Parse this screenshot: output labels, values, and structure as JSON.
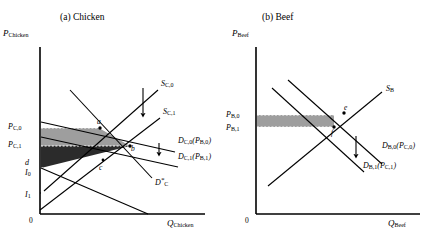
{
  "figure": {
    "panels": [
      {
        "id": "panel-a",
        "title": "(a) Chicken",
        "y_axis_label": "P",
        "y_axis_sub": "Chicken",
        "x_axis_label": "Q",
        "x_axis_sub": "Chicken",
        "origin_label": "0",
        "price_labels": [
          {
            "base": "P",
            "sub": "C,0"
          },
          {
            "base": "P",
            "sub": "C,1"
          }
        ],
        "intercept_labels": [
          {
            "base": "d",
            "sub": ""
          },
          {
            "base": "I",
            "sub": "0"
          },
          {
            "base": "I",
            "sub": "1"
          }
        ],
        "point_labels": [
          "a",
          "b",
          "c"
        ],
        "curve_labels": [
          {
            "base": "S",
            "sub": "C,0",
            "arg": ""
          },
          {
            "base": "S",
            "sub": "C,1",
            "arg": ""
          },
          {
            "base": "D",
            "sub": "C,0",
            "arg": "(P",
            "arg_sub": "B,0",
            "arg_end": ")"
          },
          {
            "base": "D",
            "sub": "C,1",
            "arg": "(P",
            "arg_sub": "B,1",
            "arg_end": ")"
          },
          {
            "base": "D",
            "sub": "C",
            "star": "*"
          }
        ]
      },
      {
        "id": "panel-b",
        "title": "(b) Beef",
        "y_axis_label": "P",
        "y_axis_sub": "Beef",
        "x_axis_label": "Q",
        "x_axis_sub": "Beef",
        "origin_label": "0",
        "price_labels": [
          {
            "base": "P",
            "sub": "B,0"
          },
          {
            "base": "P",
            "sub": "B,1"
          }
        ],
        "point_labels": [
          "e",
          "f"
        ],
        "curve_labels": [
          {
            "base": "S",
            "sub": "B",
            "arg": ""
          },
          {
            "base": "D",
            "sub": "B,0",
            "arg": "(P",
            "arg_sub": "C,0",
            "arg_end": ")"
          },
          {
            "base": "D",
            "sub": "B,1",
            "arg": "(P",
            "arg_sub": "C,1",
            "arg_end": ")"
          }
        ]
      }
    ],
    "colors": {
      "line": "#000000",
      "shade_light": "#9e9e9e",
      "shade_dark": "#2b2b2b",
      "shade_beef": "#9e9e9e",
      "background": "#ffffff"
    }
  }
}
